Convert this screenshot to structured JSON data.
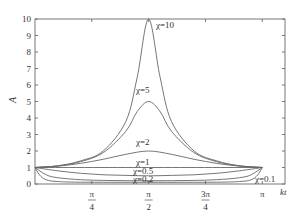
{
  "chart_data": {
    "type": "line",
    "title": "",
    "xlabel": "kt",
    "ylabel": "A",
    "xlim_pi": [
      0,
      1.1
    ],
    "ylim": [
      0,
      10
    ],
    "grid": false,
    "legend": "inline curve labels",
    "x_ticks": [
      {
        "value_pi": 0.25,
        "num": "π",
        "den": "4"
      },
      {
        "value_pi": 0.5,
        "num": "π",
        "den": "2"
      },
      {
        "value_pi": 0.75,
        "num": "3π",
        "den": "4"
      },
      {
        "value_pi": 1.0,
        "num": "π",
        "den": ""
      }
    ],
    "y_ticks": [
      0,
      1,
      2,
      3,
      4,
      5,
      6,
      7,
      8,
      9,
      10
    ],
    "series": [
      {
        "name": "χ=10",
        "chi": 10,
        "label": "χ=10",
        "x_pi": [
          0,
          0.1,
          0.2,
          0.3,
          0.4,
          0.45,
          0.5,
          0.55,
          0.6,
          0.7,
          0.8,
          0.9,
          1.0
        ],
        "values": [
          1.0,
          1.1,
          1.4,
          2.0,
          3.8,
          6.5,
          10.0,
          6.5,
          3.8,
          2.0,
          1.4,
          1.1,
          1.0
        ]
      },
      {
        "name": "χ=5",
        "chi": 5,
        "label": "χ=5",
        "x_pi": [
          0,
          0.1,
          0.2,
          0.3,
          0.4,
          0.45,
          0.5,
          0.55,
          0.6,
          0.7,
          0.8,
          0.9,
          1.0
        ],
        "values": [
          1.0,
          1.1,
          1.35,
          1.9,
          3.2,
          4.4,
          5.0,
          4.4,
          3.2,
          1.9,
          1.35,
          1.1,
          1.0
        ]
      },
      {
        "name": "χ=2",
        "chi": 2,
        "label": "χ=2",
        "x_pi": [
          0,
          0.1,
          0.2,
          0.3,
          0.4,
          0.5,
          0.6,
          0.7,
          0.8,
          0.9,
          1.0
        ],
        "values": [
          1.0,
          1.08,
          1.25,
          1.5,
          1.8,
          2.0,
          1.8,
          1.5,
          1.25,
          1.08,
          1.0
        ]
      },
      {
        "name": "χ=1",
        "chi": 1,
        "label": "χ=1",
        "x_pi": [
          0,
          0.5,
          1.0
        ],
        "values": [
          1.0,
          1.0,
          1.0
        ]
      },
      {
        "name": "χ=0.5",
        "chi": 0.5,
        "label": "χ=0.5",
        "x_pi": [
          0,
          0.1,
          0.2,
          0.3,
          0.4,
          0.5,
          0.6,
          0.7,
          0.8,
          0.9,
          1.0
        ],
        "values": [
          1.0,
          0.8,
          0.65,
          0.56,
          0.52,
          0.5,
          0.52,
          0.56,
          0.65,
          0.8,
          1.0
        ]
      },
      {
        "name": "χ=0.2",
        "chi": 0.2,
        "label": "χ=0.2",
        "x_pi": [
          0,
          0.05,
          0.1,
          0.2,
          0.3,
          0.4,
          0.5,
          0.6,
          0.7,
          0.8,
          0.9,
          0.95,
          1.0
        ],
        "values": [
          1.0,
          0.55,
          0.38,
          0.26,
          0.22,
          0.2,
          0.2,
          0.2,
          0.22,
          0.26,
          0.38,
          0.55,
          1.0
        ]
      },
      {
        "name": "χ=0.1",
        "chi": 0.1,
        "label": "χ=0.1",
        "x_pi": [
          0,
          0.02,
          0.05,
          0.1,
          0.2,
          0.5,
          0.8,
          0.9,
          0.95,
          0.98,
          1.0
        ],
        "values": [
          1.0,
          0.55,
          0.25,
          0.15,
          0.11,
          0.1,
          0.11,
          0.15,
          0.25,
          0.55,
          1.0
        ]
      }
    ]
  },
  "labels": {
    "chi10": "χ=10",
    "chi5": "χ=5",
    "chi2": "χ=2",
    "chi1": "χ=1",
    "chi05": "χ=0.5",
    "chi02": "χ=0.2",
    "chi01": "χ=0.1",
    "xlabel": "kt",
    "ylabel": "A"
  }
}
